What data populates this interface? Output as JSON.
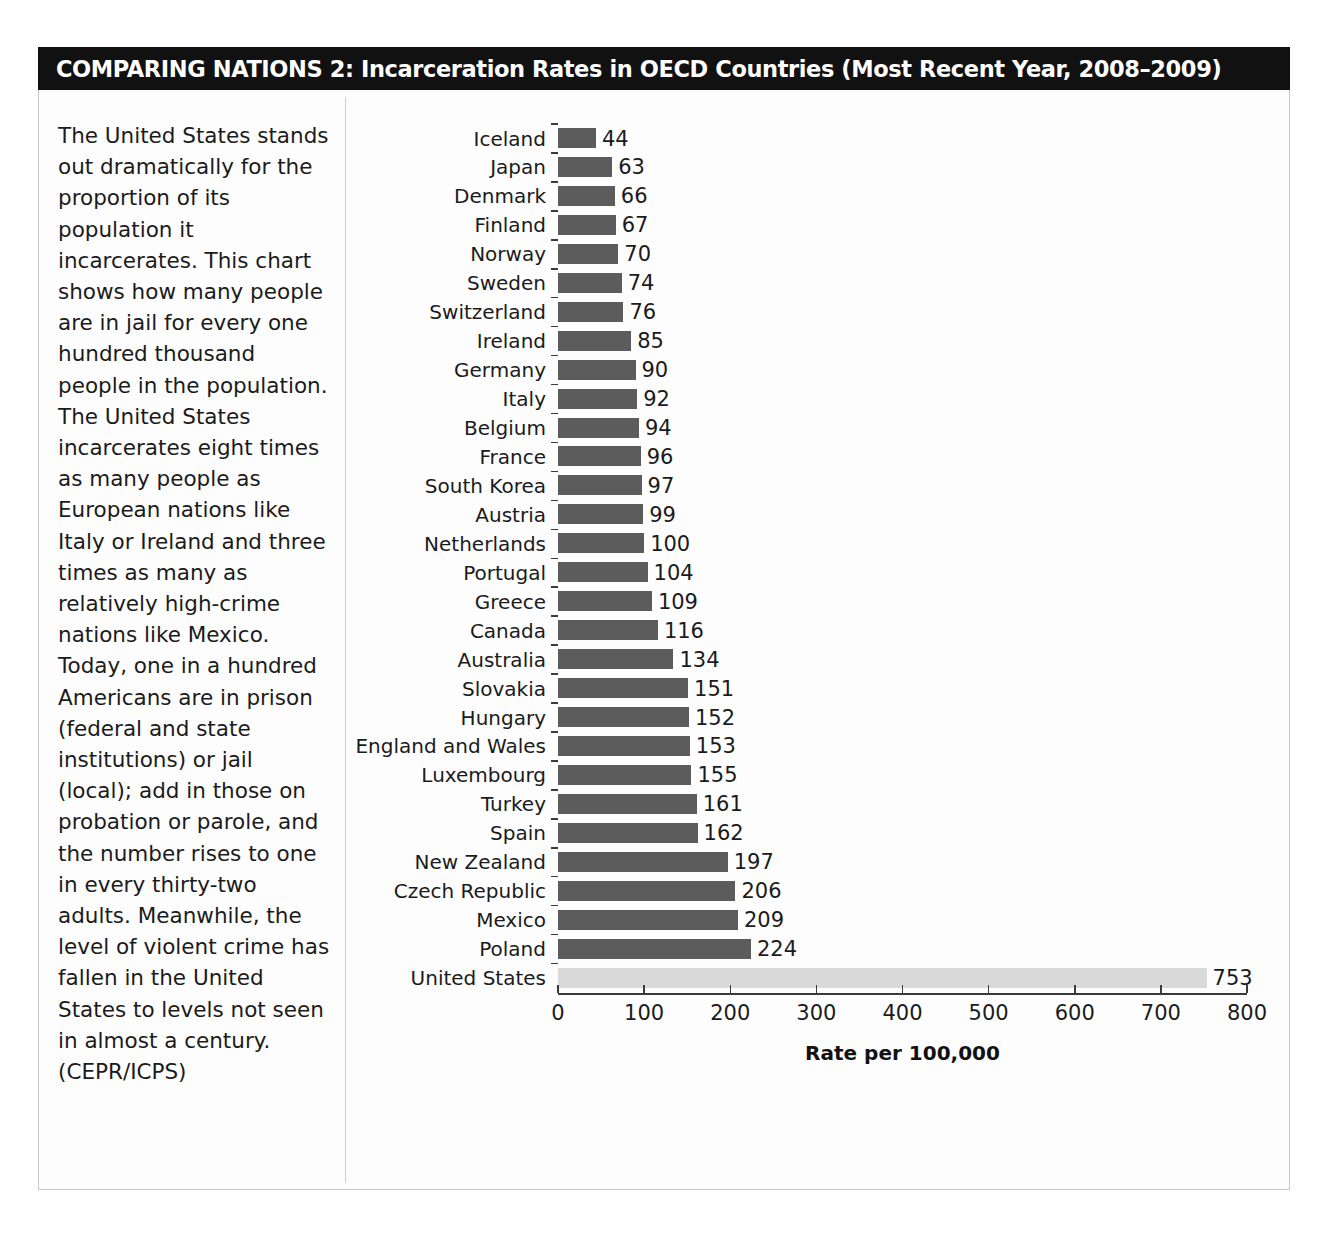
{
  "header": {
    "title": "COMPARING NATIONS 2: Incarceration Rates in OECD Countries (Most Recent Year, 2008–2009)"
  },
  "sidebar": {
    "body_text": "The United States stands out dramatically for the proportion of its population it incarcerates. This chart shows how many people are in jail for every one hundred thousand people in the population. The United States incarcerates eight times as many people as European nations like Italy or Ireland and three times as many as relatively high-crime nations like Mexico. Today, one in a hundred Americans are in prison (federal and state institutions) or jail (local); add in those on probation or parole, and the number rises to one in every thirty-two adults. Meanwhile, the level of violent crime has fallen in the United States to levels not seen in almost a century. (CEPR/ICPS)"
  },
  "colors": {
    "bar": "#5c5c5c",
    "highlight_bar": "#d9d9d9",
    "title_band": "#111111",
    "title_text": "#ffffff",
    "axis": "#3b3b3b",
    "frame": "#c9c9c9"
  },
  "chart_data": {
    "type": "bar",
    "orientation": "horizontal",
    "title": "COMPARING NATIONS 2: Incarceration Rates in OECD Countries (Most Recent Year, 2008–2009)",
    "xlabel": "Rate per 100,000",
    "ylabel": "",
    "xlim": [
      0,
      800
    ],
    "xticks": [
      0,
      100,
      200,
      300,
      400,
      500,
      600,
      700,
      800
    ],
    "xticklabels": [
      "0",
      "100",
      "200",
      "300",
      "400",
      "500",
      "600",
      "700",
      "800"
    ],
    "grid": false,
    "legend": null,
    "highlight_category": "United States",
    "value_labels": true,
    "categories": [
      "Iceland",
      "Japan",
      "Denmark",
      "Finland",
      "Norway",
      "Sweden",
      "Switzerland",
      "Ireland",
      "Germany",
      "Italy",
      "Belgium",
      "France",
      "South Korea",
      "Austria",
      "Netherlands",
      "Portugal",
      "Greece",
      "Canada",
      "Australia",
      "Slovakia",
      "Hungary",
      "England and Wales",
      "Luxembourg",
      "Turkey",
      "Spain",
      "New Zealand",
      "Czech Republic",
      "Mexico",
      "Poland",
      "United States"
    ],
    "values": [
      44,
      63,
      66,
      67,
      70,
      74,
      76,
      85,
      90,
      92,
      94,
      96,
      97,
      99,
      100,
      104,
      109,
      116,
      134,
      151,
      152,
      153,
      155,
      161,
      162,
      197,
      206,
      209,
      224,
      753
    ]
  }
}
